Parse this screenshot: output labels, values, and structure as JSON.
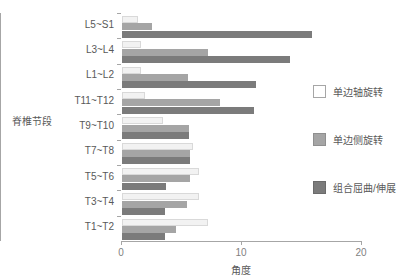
{
  "chart_data": {
    "type": "bar",
    "orientation": "horizontal",
    "title": "",
    "xlabel": "角度",
    "ylabel": "脊椎节段",
    "xlim": [
      0,
      20
    ],
    "xticks": [
      "0",
      "10",
      "20"
    ],
    "xtick_values": [
      0,
      10,
      20
    ],
    "grid": false,
    "legend_position": "right",
    "categories": [
      "L5~S1",
      "L3~L4",
      "L1~L2",
      "T11~T12",
      "T9~T10",
      "T7~T8",
      "T5~T6",
      "T3~T4",
      "T1~T2"
    ],
    "series": [
      {
        "name": "单边轴旋转",
        "color": "#f2f2f2",
        "values": [
          1.3,
          1.6,
          1.6,
          1.9,
          3.4,
          5.9,
          6.4,
          6.4,
          7.2
        ]
      },
      {
        "name": "单边侧旋转",
        "color": "#a5a5a5",
        "values": [
          2.5,
          7.2,
          5.5,
          8.2,
          5.6,
          5.7,
          5.7,
          5.4,
          4.5
        ]
      },
      {
        "name": "组合屈曲/伸展",
        "color": "#7b7b7b",
        "values": [
          15.8,
          14.0,
          11.2,
          11.0,
          5.6,
          5.7,
          3.7,
          3.6,
          3.6
        ]
      }
    ]
  },
  "legend": {
    "items": [
      {
        "label": "单边轴旋转"
      },
      {
        "label": "单边侧旋转"
      },
      {
        "label": "组合屈曲/伸展"
      }
    ]
  },
  "axes": {
    "y_title": "脊椎节段",
    "x_title": "角度"
  }
}
